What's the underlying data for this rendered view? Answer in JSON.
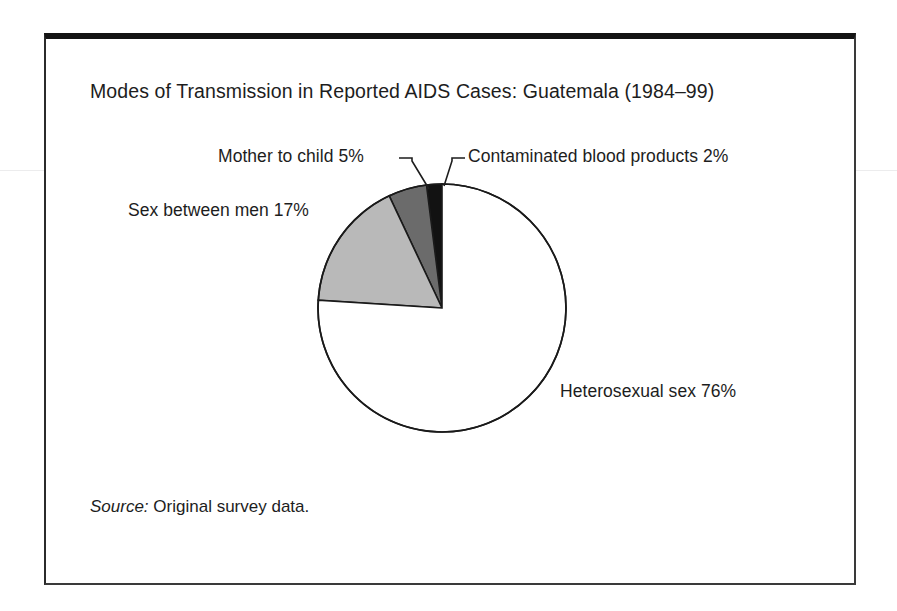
{
  "figure": {
    "title": "Modes of Transmission in Reported AIDS Cases: Guatemala (1984–99)",
    "source_label": "Source:",
    "source_text": "Original survey data."
  },
  "chart_data": {
    "type": "pie",
    "title": "Modes of Transmission in Reported AIDS Cases: Guatemala (1984–99)",
    "xlabel": "",
    "ylabel": "",
    "unit": "percent",
    "total": 100,
    "start_angle_deg": 0,
    "direction": "counterclockwise",
    "legend": "none (direct labels)",
    "grid": false,
    "categories": [
      "Contaminated blood products",
      "Mother to child",
      "Sex between men",
      "Heterosexual sex"
    ],
    "values": [
      2,
      5,
      17,
      76
    ],
    "labels": [
      "Contaminated blood products 2%",
      "Mother to child 5%",
      "Sex between men 17%",
      "Heterosexual sex 76%"
    ],
    "slices": [
      {
        "name": "Contaminated blood products",
        "value": 2,
        "label": "Contaminated blood products 2%",
        "color": "#121212",
        "stroke": "#1a1a1a",
        "leader": true
      },
      {
        "name": "Mother to child",
        "value": 5,
        "label": "Mother to child 5%",
        "color": "#6b6b6b",
        "stroke": "#1a1a1a",
        "leader": true
      },
      {
        "name": "Sex between men",
        "value": 17,
        "label": "Sex between men 17%",
        "color": "#b9b9b9",
        "stroke": "#1a1a1a",
        "leader": false
      },
      {
        "name": "Heterosexual sex",
        "value": 76,
        "label": "Heterosexual sex 76%",
        "color": "#ffffff",
        "stroke": "#1a1a1a",
        "leader": false
      }
    ],
    "geometry": {
      "center_x": 442,
      "center_y": 308,
      "radius": 124
    }
  },
  "colors": {
    "frame": "#2b2b2b",
    "frame_top": "#141414",
    "text": "#1d1d1d",
    "slice_black": "#121212",
    "slice_dark_gray": "#6b6b6b",
    "slice_light_gray": "#b9b9b9",
    "slice_white": "#ffffff",
    "background": "#ffffff"
  }
}
